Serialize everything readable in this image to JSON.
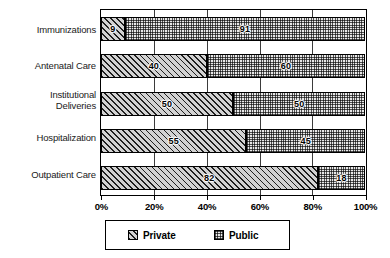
{
  "chart_data": {
    "type": "bar",
    "orientation": "horizontal",
    "stacked": "100%",
    "title": "",
    "xlabel": "",
    "ylabel": "",
    "xlim": [
      0,
      100
    ],
    "xticks": [
      "0%",
      "20%",
      "40%",
      "60%",
      "80%",
      "100%"
    ],
    "xtick_values": [
      0,
      20,
      40,
      60,
      80,
      100
    ],
    "grid": true,
    "grid_axis": "x",
    "legend_position": "bottom",
    "categories": [
      "Immunizations",
      "Antenatal Care",
      "Institutional Deliveries",
      "Hospitalization",
      "Outpatient Care"
    ],
    "series": [
      {
        "name": "Private",
        "pattern": "diagonal-hatch",
        "values": [
          9,
          40,
          50,
          55,
          82
        ]
      },
      {
        "name": "Public",
        "pattern": "dotted-checker",
        "values": [
          91,
          60,
          50,
          45,
          18
        ]
      }
    ]
  },
  "axis": {
    "category_labels": [
      {
        "line1": "Immunizations",
        "line2": ""
      },
      {
        "line1": "Antenatal Care",
        "line2": ""
      },
      {
        "line1": "Institutional",
        "line2": "Deliveries"
      },
      {
        "line1": "Hospitalization",
        "line2": ""
      },
      {
        "line1": "Outpatient Care",
        "line2": ""
      }
    ],
    "tick_labels": [
      "0%",
      "20%",
      "40%",
      "60%",
      "80%",
      "100%"
    ]
  },
  "legend": {
    "items": [
      {
        "label": "Private",
        "pattern": "diagonal-hatch"
      },
      {
        "label": "Public",
        "pattern": "dotted-checker"
      }
    ]
  },
  "values_private": [
    "9",
    "40",
    "50",
    "55",
    "82"
  ],
  "values_public": [
    "91",
    "60",
    "50",
    "45",
    "18"
  ],
  "colors": {
    "axis": "#000000",
    "grid": "#3b3b3b",
    "private_fill": "#d2d2d2",
    "public_fill": "#e8e8e8",
    "text": "#000000",
    "background": "#ffffff"
  }
}
